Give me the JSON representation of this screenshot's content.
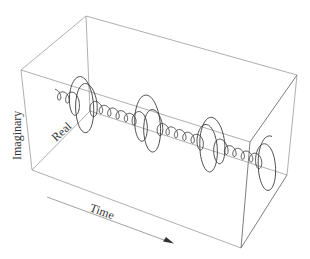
{
  "diagram": {
    "type": "3d-helix-complex-signal",
    "labels": {
      "imaginary": "Imaginary",
      "real": "Real",
      "time": "Time"
    },
    "box_corners": {
      "front_top_left": [
        21,
        70
      ],
      "back_top_left": [
        86,
        16
      ],
      "back_top_right": [
        297,
        75
      ],
      "front_top_right": [
        250,
        142
      ],
      "front_bottom_left": [
        32,
        170
      ],
      "back_bottom_left": [
        90,
        111
      ],
      "back_bottom_right": [
        287,
        175
      ],
      "front_bottom_right": [
        241,
        248
      ]
    },
    "time_arrow": {
      "from": [
        47,
        197
      ],
      "to": [
        172,
        243
      ]
    },
    "large_loops": 4,
    "colors": {
      "box_edges": "#9a9a9a",
      "helix": "#3a3a3a",
      "text": "#333333"
    }
  }
}
